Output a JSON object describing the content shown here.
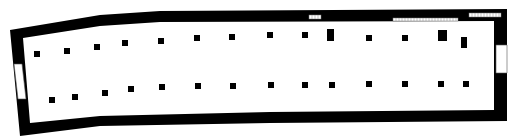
{
  "plan": {
    "type": "floor-plan",
    "wall_color": "#000000",
    "background_color": "#ffffff",
    "outer_outline": [
      [
        10,
        30
      ],
      [
        100,
        15
      ],
      [
        160,
        11
      ],
      [
        507,
        9
      ],
      [
        507,
        121
      ],
      [
        270,
        123
      ],
      [
        100,
        126
      ],
      [
        20,
        136
      ]
    ],
    "inner_outline": [
      [
        23,
        38
      ],
      [
        100,
        26
      ],
      [
        160,
        22
      ],
      [
        494,
        21
      ],
      [
        494,
        110
      ],
      [
        270,
        112
      ],
      [
        100,
        116
      ],
      [
        30,
        123
      ]
    ],
    "openings": [
      {
        "name": "west-doorway",
        "points": [
          [
            14,
            64
          ],
          [
            22,
            64
          ],
          [
            26,
            99
          ],
          [
            18,
            99
          ]
        ]
      },
      {
        "name": "east-doorway",
        "points": [
          [
            496,
            45
          ],
          [
            507,
            45
          ],
          [
            507,
            73
          ],
          [
            496,
            73
          ]
        ]
      }
    ],
    "windows": [
      {
        "name": "north-window-1",
        "x": 309,
        "y": 15,
        "w": 12,
        "h": 4
      },
      {
        "name": "north-window-2",
        "x": 393,
        "y": 18,
        "w": 65,
        "h": 3
      },
      {
        "name": "north-window-3",
        "x": 469,
        "y": 13,
        "w": 32,
        "h": 4
      }
    ],
    "piers_north": [
      {
        "x": 34,
        "y": 51,
        "w": 6,
        "h": 6
      },
      {
        "x": 64,
        "y": 48,
        "w": 6,
        "h": 6
      },
      {
        "x": 94,
        "y": 44,
        "w": 6,
        "h": 6
      },
      {
        "x": 122,
        "y": 40,
        "w": 6,
        "h": 6
      },
      {
        "x": 158,
        "y": 38,
        "w": 6,
        "h": 6
      },
      {
        "x": 194,
        "y": 35,
        "w": 6,
        "h": 6
      },
      {
        "x": 229,
        "y": 34,
        "w": 6,
        "h": 6
      },
      {
        "x": 267,
        "y": 32,
        "w": 6,
        "h": 6
      },
      {
        "x": 302,
        "y": 32,
        "w": 6,
        "h": 6
      },
      {
        "x": 327,
        "y": 29,
        "w": 7,
        "h": 12
      },
      {
        "x": 366,
        "y": 35,
        "w": 6,
        "h": 6
      },
      {
        "x": 402,
        "y": 35,
        "w": 6,
        "h": 6
      },
      {
        "x": 438,
        "y": 30,
        "w": 9,
        "h": 11
      },
      {
        "x": 461,
        "y": 37,
        "w": 6,
        "h": 11
      },
      {
        "x": 494,
        "y": 34,
        "w": 6,
        "h": 6
      }
    ],
    "piers_south": [
      {
        "x": 49,
        "y": 97,
        "w": 6,
        "h": 6
      },
      {
        "x": 72,
        "y": 94,
        "w": 6,
        "h": 6
      },
      {
        "x": 102,
        "y": 90,
        "w": 6,
        "h": 6
      },
      {
        "x": 128,
        "y": 86,
        "w": 6,
        "h": 6
      },
      {
        "x": 159,
        "y": 84,
        "w": 6,
        "h": 6
      },
      {
        "x": 195,
        "y": 83,
        "w": 6,
        "h": 6
      },
      {
        "x": 230,
        "y": 83,
        "w": 6,
        "h": 6
      },
      {
        "x": 268,
        "y": 82,
        "w": 6,
        "h": 6
      },
      {
        "x": 302,
        "y": 82,
        "w": 6,
        "h": 6
      },
      {
        "x": 329,
        "y": 82,
        "w": 6,
        "h": 6
      },
      {
        "x": 366,
        "y": 81,
        "w": 6,
        "h": 6
      },
      {
        "x": 402,
        "y": 81,
        "w": 6,
        "h": 6
      },
      {
        "x": 438,
        "y": 81,
        "w": 6,
        "h": 6
      },
      {
        "x": 463,
        "y": 81,
        "w": 6,
        "h": 6
      },
      {
        "x": 496,
        "y": 81,
        "w": 6,
        "h": 6
      }
    ]
  }
}
